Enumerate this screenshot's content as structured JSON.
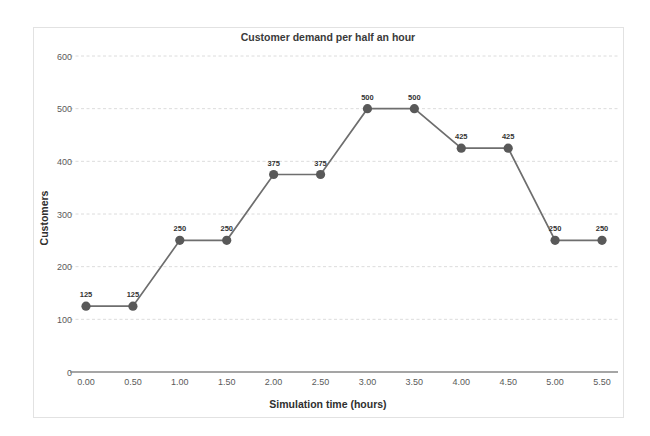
{
  "chart_data": {
    "type": "line",
    "title": "Customer demand per half an hour",
    "xlabel": "Simulation time (hours)",
    "ylabel": "Customers",
    "x": [
      0.0,
      0.5,
      1.0,
      1.5,
      2.0,
      2.5,
      3.0,
      3.5,
      4.0,
      4.5,
      5.0,
      5.5
    ],
    "xtick_labels": [
      "0.00",
      "0.50",
      "1.00",
      "1.50",
      "2.00",
      "2.50",
      "3.00",
      "3.50",
      "4.00",
      "4.50",
      "5.00",
      "5.50"
    ],
    "values": [
      125,
      125,
      250,
      250,
      375,
      375,
      500,
      500,
      425,
      425,
      250,
      250
    ],
    "point_labels": [
      "125",
      "125",
      "250",
      "250",
      "375",
      "375",
      "500",
      "500",
      "425",
      "425",
      "250",
      "250"
    ],
    "yticks": [
      0,
      100,
      200,
      300,
      400,
      500,
      600
    ],
    "ytick_labels": [
      "0",
      "100",
      "200",
      "300",
      "400",
      "500",
      "600"
    ],
    "ylim": [
      0,
      600
    ],
    "xlim": [
      0.0,
      5.5
    ],
    "grid": true,
    "legend": false,
    "series_name": "Customer demand",
    "colors": {
      "line": "#6e6e6e",
      "marker": "#595959",
      "grid": "#dcdcdc",
      "axis": "#878787",
      "frame": "#e2e2e2",
      "text": "#3a3a3a",
      "background": "#ffffff"
    }
  }
}
